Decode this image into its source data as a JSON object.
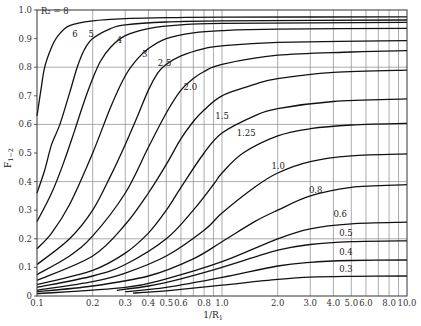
{
  "chart_data": {
    "type": "line",
    "title": "",
    "xlabel": "1/R1",
    "ylabel": "F1-2",
    "xscale": "log",
    "xlim": [
      0.1,
      10.0
    ],
    "ylim": [
      0,
      1.0
    ],
    "grid": true,
    "legend": "none (curves labeled inline)",
    "x_ticks": [
      "0.1",
      "0.2",
      "0.3",
      "0.4",
      "0.5",
      "0.6",
      "0.8",
      "1.0",
      "2.0",
      "3.0",
      "4.0",
      "5.0",
      "6.0",
      "8.0",
      "10.0"
    ],
    "x_tick_values": [
      0.1,
      0.2,
      0.3,
      0.4,
      0.5,
      0.6,
      0.8,
      1.0,
      2.0,
      3.0,
      4.0,
      5.0,
      6.0,
      8.0,
      10.0
    ],
    "x_grid_values": [
      0.2,
      0.3,
      0.4,
      0.5,
      0.6,
      0.7,
      0.8,
      0.9,
      1.0,
      2.0,
      3.0,
      4.0,
      5.0,
      6.0,
      7.0,
      8.0,
      9.0
    ],
    "y_ticks": [
      "0",
      "0.1",
      "0.2",
      "0.3",
      "0.4",
      "0.5",
      "0.6",
      "0.7",
      "0.8",
      "0.9",
      "1.0"
    ],
    "y_tick_values": [
      0,
      0.1,
      0.2,
      0.3,
      0.4,
      0.5,
      0.6,
      0.7,
      0.8,
      0.9,
      1.0
    ],
    "y_grid_values": [
      0.2,
      0.4,
      0.6,
      0.8
    ],
    "series": [
      {
        "name": "R2 = 8",
        "label": "R₂ = 8",
        "label_pos": [
          0.105,
          0.985
        ],
        "points": [
          [
            0.1,
            0.63
          ],
          [
            0.105,
            0.72
          ],
          [
            0.11,
            0.8
          ],
          [
            0.12,
            0.87
          ],
          [
            0.13,
            0.91
          ],
          [
            0.15,
            0.945
          ],
          [
            0.2,
            0.962
          ],
          [
            0.3,
            0.97
          ],
          [
            0.5,
            0.973
          ],
          [
            1,
            0.975
          ],
          [
            10,
            0.976
          ]
        ]
      },
      {
        "name": "R2 = 6",
        "label": "6",
        "label_pos": [
          0.155,
          0.905
        ],
        "points": [
          [
            0.1,
            0.36
          ],
          [
            0.11,
            0.44
          ],
          [
            0.12,
            0.53
          ],
          [
            0.133,
            0.6
          ],
          [
            0.15,
            0.71
          ],
          [
            0.165,
            0.8
          ],
          [
            0.18,
            0.86
          ],
          [
            0.2,
            0.9
          ],
          [
            0.25,
            0.935
          ],
          [
            0.3,
            0.948
          ],
          [
            0.5,
            0.958
          ],
          [
            1,
            0.962
          ],
          [
            10,
            0.965
          ]
        ]
      },
      {
        "name": "R2 = 5",
        "label": "5",
        "label_pos": [
          0.19,
          0.905
        ],
        "points": [
          [
            0.1,
            0.26
          ],
          [
            0.12,
            0.36
          ],
          [
            0.14,
            0.47
          ],
          [
            0.16,
            0.58
          ],
          [
            0.18,
            0.68
          ],
          [
            0.2,
            0.76
          ],
          [
            0.22,
            0.82
          ],
          [
            0.25,
            0.87
          ],
          [
            0.3,
            0.91
          ],
          [
            0.4,
            0.935
          ],
          [
            0.6,
            0.948
          ],
          [
            1,
            0.953
          ],
          [
            10,
            0.957
          ]
        ]
      },
      {
        "name": "R2 = 4",
        "label": "4",
        "label_pos": [
          0.27,
          0.885
        ],
        "points": [
          [
            0.1,
            0.165
          ],
          [
            0.12,
            0.22
          ],
          [
            0.15,
            0.32
          ],
          [
            0.2,
            0.5
          ],
          [
            0.25,
            0.66
          ],
          [
            0.3,
            0.77
          ],
          [
            0.35,
            0.83
          ],
          [
            0.4,
            0.865
          ],
          [
            0.5,
            0.9
          ],
          [
            0.7,
            0.92
          ],
          [
            1,
            0.928
          ],
          [
            2,
            0.933
          ],
          [
            10,
            0.936
          ]
        ]
      },
      {
        "name": "R2 = 3",
        "label": "3",
        "label_pos": [
          0.37,
          0.835
        ],
        "points": [
          [
            0.1,
            0.11
          ],
          [
            0.15,
            0.2
          ],
          [
            0.2,
            0.3
          ],
          [
            0.25,
            0.42
          ],
          [
            0.3,
            0.53
          ],
          [
            0.35,
            0.63
          ],
          [
            0.4,
            0.72
          ],
          [
            0.45,
            0.78
          ],
          [
            0.5,
            0.81
          ],
          [
            0.6,
            0.84
          ],
          [
            0.8,
            0.865
          ],
          [
            1,
            0.875
          ],
          [
            2,
            0.887
          ],
          [
            10,
            0.893
          ]
        ]
      },
      {
        "name": "R2 = 2.5",
        "label": "2.5",
        "label_pos": [
          0.45,
          0.805
        ],
        "points": [
          [
            0.1,
            0.075
          ],
          [
            0.15,
            0.14
          ],
          [
            0.2,
            0.21
          ],
          [
            0.3,
            0.36
          ],
          [
            0.4,
            0.52
          ],
          [
            0.5,
            0.64
          ],
          [
            0.6,
            0.72
          ],
          [
            0.7,
            0.76
          ],
          [
            0.8,
            0.785
          ],
          [
            1,
            0.81
          ],
          [
            2,
            0.842
          ],
          [
            5,
            0.853
          ],
          [
            10,
            0.858
          ]
        ]
      },
      {
        "name": "R2 = 2.0",
        "label": "2.0",
        "label_pos": [
          0.62,
          0.72
        ],
        "points": [
          [
            0.1,
            0.055
          ],
          [
            0.2,
            0.14
          ],
          [
            0.3,
            0.25
          ],
          [
            0.4,
            0.36
          ],
          [
            0.5,
            0.46
          ],
          [
            0.6,
            0.55
          ],
          [
            0.7,
            0.61
          ],
          [
            0.8,
            0.65
          ],
          [
            1,
            0.7
          ],
          [
            1.5,
            0.74
          ],
          [
            2,
            0.76
          ],
          [
            4,
            0.782
          ],
          [
            10,
            0.79
          ]
        ]
      },
      {
        "name": "R2 = 1.5",
        "label": "1.5",
        "label_pos": [
          0.92,
          0.62
        ],
        "points": [
          [
            0.1,
            0.04
          ],
          [
            0.2,
            0.09
          ],
          [
            0.3,
            0.15
          ],
          [
            0.4,
            0.22
          ],
          [
            0.5,
            0.3
          ],
          [
            0.6,
            0.38
          ],
          [
            0.8,
            0.5
          ],
          [
            1,
            0.57
          ],
          [
            1.5,
            0.63
          ],
          [
            2,
            0.655
          ],
          [
            4,
            0.68
          ],
          [
            10,
            0.689
          ]
        ]
      },
      {
        "name": "R2 = 1.25",
        "label": "1.25",
        "label_pos": [
          1.2,
          0.56
        ],
        "points": [
          [
            0.1,
            0.03
          ],
          [
            0.2,
            0.07
          ],
          [
            0.3,
            0.11
          ],
          [
            0.5,
            0.2
          ],
          [
            0.7,
            0.3
          ],
          [
            0.9,
            0.39
          ],
          [
            1,
            0.43
          ],
          [
            1.3,
            0.5
          ],
          [
            2,
            0.56
          ],
          [
            3,
            0.585
          ],
          [
            5,
            0.598
          ],
          [
            10,
            0.604
          ]
        ]
      },
      {
        "name": "R2 = 1.0",
        "label": "1.0",
        "label_pos": [
          1.85,
          0.445
        ],
        "points": [
          [
            0.1,
            0.02
          ],
          [
            0.2,
            0.05
          ],
          [
            0.3,
            0.08
          ],
          [
            0.5,
            0.14
          ],
          [
            0.8,
            0.23
          ],
          [
            1,
            0.29
          ],
          [
            1.5,
            0.38
          ],
          [
            2,
            0.43
          ],
          [
            3,
            0.47
          ],
          [
            5,
            0.49
          ],
          [
            10,
            0.497
          ]
        ]
      },
      {
        "name": "R2 = 0.8",
        "label": "0.8",
        "label_pos": [
          2.95,
          0.36
        ],
        "points": [
          [
            0.1,
            0.015
          ],
          [
            0.2,
            0.035
          ],
          [
            0.4,
            0.07
          ],
          [
            0.7,
            0.13
          ],
          [
            1,
            0.19
          ],
          [
            1.5,
            0.26
          ],
          [
            2,
            0.3
          ],
          [
            3,
            0.35
          ],
          [
            5,
            0.38
          ],
          [
            10,
            0.389
          ]
        ]
      },
      {
        "name": "R2 = 0.6",
        "label": "0.6",
        "label_pos": [
          4.0,
          0.275
        ],
        "points": [
          [
            0.1,
            0.008
          ],
          [
            0.3,
            0.03
          ],
          [
            0.5,
            0.06
          ],
          [
            1,
            0.12
          ],
          [
            2,
            0.2
          ],
          [
            3,
            0.235
          ],
          [
            5,
            0.252
          ],
          [
            10,
            0.258
          ]
        ]
      },
      {
        "name": "R2 = 0.5",
        "label": "0.5",
        "label_pos": [
          4.3,
          0.21
        ],
        "points": [
          [
            0.27,
            0.02
          ],
          [
            0.4,
            0.035
          ],
          [
            0.6,
            0.06
          ],
          [
            1,
            0.1
          ],
          [
            2,
            0.16
          ],
          [
            3,
            0.18
          ],
          [
            5,
            0.19
          ],
          [
            10,
            0.193
          ]
        ]
      },
      {
        "name": "R2 = 0.4",
        "label": "0.4",
        "label_pos": [
          4.3,
          0.145
        ],
        "points": [
          [
            0.3,
            0.015
          ],
          [
            0.5,
            0.03
          ],
          [
            1,
            0.065
          ],
          [
            2,
            0.105
          ],
          [
            3,
            0.118
          ],
          [
            5,
            0.124
          ],
          [
            10,
            0.126
          ]
        ]
      },
      {
        "name": "R2 = 0.3",
        "label": "0.3",
        "label_pos": [
          4.3,
          0.085
        ],
        "points": [
          [
            0.33,
            0.01
          ],
          [
            0.5,
            0.018
          ],
          [
            1,
            0.038
          ],
          [
            2,
            0.058
          ],
          [
            3,
            0.066
          ],
          [
            5,
            0.069
          ],
          [
            10,
            0.07
          ]
        ]
      }
    ]
  },
  "axes": {
    "xlabel_text": "1/R",
    "xlabel_sub": "1",
    "ylabel_text": "F",
    "ylabel_sub": "1−2"
  }
}
